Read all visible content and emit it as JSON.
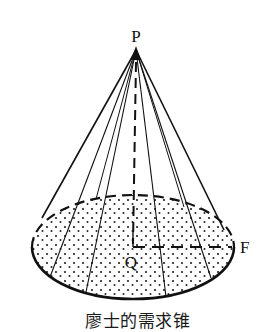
{
  "diagram": {
    "type": "cone",
    "labels": {
      "apex": "P",
      "center": "Q",
      "rim_point": "F"
    },
    "caption": "廖士的需求锥",
    "colors": {
      "ink": "#111111",
      "background": "#ffffff"
    },
    "geometry": {
      "apex": [
        136,
        50
      ],
      "base_center": [
        133,
        247
      ],
      "base_rx": 101,
      "base_ry": 52
    }
  }
}
